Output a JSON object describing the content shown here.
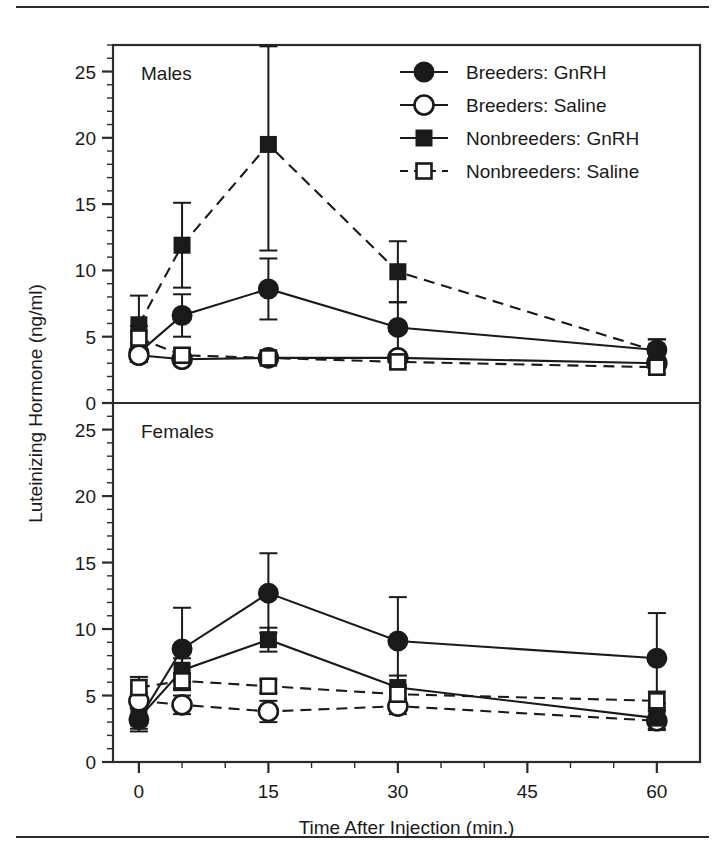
{
  "figure": {
    "ylabel": "Luteinizing Hormone (ng/ml)",
    "xlabel": "Time After Injection (min.)",
    "panel_top_label": "Males",
    "panel_bottom_label": "Females"
  },
  "legend": {
    "items": [
      {
        "label": "Breeders: GnRH",
        "marker": "filled-circle",
        "line": "solid",
        "key": "breeders_gnrh"
      },
      {
        "label": "Breeders: Saline",
        "marker": "open-circle",
        "line": "solid",
        "key": "breeders_saline"
      },
      {
        "label": "Nonbreeders: GnRH",
        "marker": "filled-square",
        "line": "solid",
        "key": "nonbreeders_gnrh"
      },
      {
        "label": "Nonbreeders: Saline",
        "marker": "open-square",
        "line": "dashed",
        "key": "nonbreeders_saline"
      }
    ]
  },
  "chart_data": {
    "type": "line",
    "title": "",
    "xlabel": "Time After Injection (min.)",
    "ylabel": "Luteinizing Hormone (ng/ml)",
    "xlim": [
      -3,
      65
    ],
    "ylim": [
      0,
      27
    ],
    "xticks": [
      0,
      15,
      30,
      45,
      60
    ],
    "xtick_labels": [
      "0",
      "15",
      "30",
      "45",
      "60"
    ],
    "x_minor_step": 5,
    "yticks": [
      0,
      5,
      10,
      15,
      20,
      25
    ],
    "ytick_labels": [
      "0",
      "5",
      "10",
      "15",
      "20",
      "25"
    ],
    "y_minor_step": 1,
    "grid": false,
    "legend_position": "top-right",
    "error_bars": "mean +/- SE",
    "panels": [
      {
        "name": "Males",
        "x": [
          0,
          5,
          15,
          30,
          60
        ],
        "series": [
          {
            "name": "Breeders: GnRH",
            "marker": "filled-circle",
            "line": "solid",
            "values": [
              3.8,
              6.6,
              8.6,
              5.7,
              4.0
            ],
            "err_up": [
              0.7,
              1.6,
              2.3,
              1.9,
              0.8
            ],
            "err_down": [
              0.7,
              1.6,
              2.3,
              1.9,
              0.8
            ]
          },
          {
            "name": "Breeders: Saline",
            "marker": "open-circle",
            "line": "solid",
            "values": [
              3.6,
              3.3,
              3.4,
              3.4,
              3.0
            ],
            "err_up": [
              0.5,
              0.4,
              0.4,
              0.4,
              0.4
            ],
            "err_down": [
              0.5,
              0.4,
              0.4,
              0.4,
              0.4
            ]
          },
          {
            "name": "Nonbreeders: GnRH",
            "marker": "filled-square",
            "line": "dashed",
            "values": [
              5.9,
              11.9,
              19.5,
              9.9,
              3.9
            ],
            "err_up": [
              2.2,
              3.2,
              7.4,
              2.3,
              0.9
            ],
            "err_down": [
              2.2,
              3.2,
              8.0,
              2.3,
              0.9
            ]
          },
          {
            "name": "Nonbreeders: Saline",
            "marker": "open-square",
            "line": "dashed",
            "values": [
              4.9,
              3.6,
              3.4,
              3.1,
              2.7
            ],
            "err_up": [
              0.9,
              0.5,
              0.4,
              0.4,
              0.5
            ],
            "err_down": [
              0.9,
              0.5,
              0.4,
              0.4,
              0.5
            ]
          }
        ]
      },
      {
        "name": "Females",
        "x": [
          0,
          5,
          15,
          30,
          60
        ],
        "series": [
          {
            "name": "Breeders: GnRH",
            "marker": "filled-circle",
            "line": "solid",
            "values": [
              3.2,
              8.5,
              12.7,
              9.1,
              7.8
            ],
            "err_up": [
              0.9,
              3.1,
              3.0,
              3.3,
              3.4
            ],
            "err_down": [
              0.9,
              3.1,
              3.0,
              3.3,
              3.4
            ]
          },
          {
            "name": "Breeders: Saline",
            "marker": "open-circle",
            "line": "dashed",
            "values": [
              4.6,
              4.3,
              3.8,
              4.2,
              3.1
            ],
            "err_up": [
              0.6,
              0.7,
              0.8,
              0.6,
              0.7
            ],
            "err_down": [
              0.6,
              0.7,
              0.8,
              0.6,
              0.7
            ]
          },
          {
            "name": "Nonbreeders: GnRH",
            "marker": "filled-square",
            "line": "solid",
            "values": [
              3.3,
              6.9,
              9.2,
              5.6,
              3.3
            ],
            "err_up": [
              0.8,
              0.9,
              0.9,
              0.9,
              0.8
            ],
            "err_down": [
              0.8,
              0.9,
              0.9,
              0.9,
              0.8
            ]
          },
          {
            "name": "Nonbreeders: Saline",
            "marker": "open-square",
            "line": "dashed",
            "values": [
              5.6,
              6.1,
              5.7,
              5.1,
              4.6
            ],
            "err_up": [
              0.8,
              0.6,
              0.5,
              0.5,
              0.7
            ],
            "err_down": [
              0.8,
              0.6,
              0.5,
              0.5,
              0.7
            ]
          }
        ]
      }
    ]
  },
  "colors": {
    "ink": "#1a1a1a",
    "axis": "#2b2b2b",
    "background": "#ffffff"
  }
}
